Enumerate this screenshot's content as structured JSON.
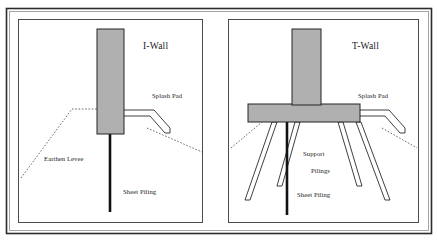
{
  "figure": {
    "background_color": "#ffffff",
    "concrete_fill_color": "#b0b0b0",
    "line_color": "#242424",
    "levee_line_color": "#5a5a5a",
    "sheet_pile_color": "#121212"
  },
  "panels": [
    {
      "id": "i-wall",
      "title": "I-Wall",
      "labels": {
        "splash_pad": "Splash Pad",
        "earthen_levee": "Earthen Levee",
        "sheet_piling": "Sheet Piling"
      }
    },
    {
      "id": "t-wall",
      "title": "T-Wall",
      "labels": {
        "splash_pad": "Splash Pad",
        "support_pilings_line1": "Support",
        "support_pilings_line2": "Pilings",
        "sheet_piling": "Sheet Piling"
      }
    }
  ]
}
